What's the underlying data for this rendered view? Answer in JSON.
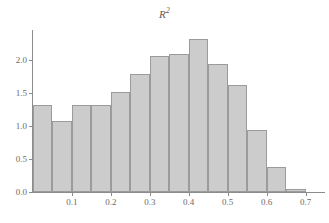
{
  "chart_data": {
    "type": "bar",
    "title_base": "R",
    "title_exponent": "2",
    "xlabel": "",
    "ylabel": "",
    "bin_width": 0.05,
    "bin_starts": [
      0.0,
      0.05,
      0.1,
      0.15,
      0.2,
      0.25,
      0.3,
      0.35,
      0.4,
      0.45,
      0.5,
      0.55,
      0.6,
      0.65
    ],
    "categories": [
      "0.00-0.05",
      "0.05-0.10",
      "0.10-0.15",
      "0.15-0.20",
      "0.20-0.25",
      "0.25-0.30",
      "0.30-0.35",
      "0.35-0.40",
      "0.40-0.45",
      "0.45-0.50",
      "0.50-0.55",
      "0.55-0.60",
      "0.60-0.65",
      "0.65-0.70"
    ],
    "values": [
      1.31,
      1.07,
      1.32,
      1.32,
      1.51,
      1.79,
      2.06,
      2.08,
      2.32,
      1.94,
      1.62,
      0.94,
      0.38,
      0.04
    ],
    "xlim": [
      0.0,
      0.75
    ],
    "ylim": [
      0.0,
      2.45
    ],
    "x_ticks": [
      0.1,
      0.2,
      0.3,
      0.4,
      0.5,
      0.6,
      0.7
    ],
    "x_tick_labels": [
      "0.1",
      "0.2",
      "0.3",
      "0.4",
      "0.5",
      "0.6",
      "0.7"
    ],
    "y_ticks": [
      0.0,
      0.5,
      1.0,
      1.5,
      2.0
    ],
    "y_tick_labels": [
      "0.0",
      "0.5",
      "1.0",
      "1.5",
      "2.0"
    ],
    "grid": false,
    "legend": null,
    "bar_fill_color": "#cccccc",
    "bar_edge_color": "#9b9b9b",
    "axis_color": "#8c8c8c",
    "text_color": "#6a6a6a",
    "background_color": "#ffffff"
  }
}
